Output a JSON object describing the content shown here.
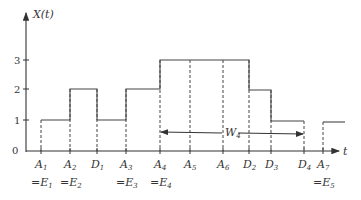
{
  "chart_data": {
    "type": "step",
    "title": "",
    "ylabel": "X(t)",
    "xlabel": "t",
    "yticks": [
      "0",
      "1",
      "2",
      "3"
    ],
    "ylim": [
      0,
      3
    ],
    "events": [
      {
        "name": "A",
        "sub": "1",
        "eq": "=E",
        "eqsub": "1",
        "x": 41
      },
      {
        "name": "A",
        "sub": "2",
        "eq": "=E",
        "eqsub": "2",
        "x": 70
      },
      {
        "name": "D",
        "sub": "1",
        "eq": "",
        "eqsub": "",
        "x": 97
      },
      {
        "name": "A",
        "sub": "3",
        "eq": "=E",
        "eqsub": "3",
        "x": 126
      },
      {
        "name": "A",
        "sub": "4",
        "eq": "=E",
        "eqsub": "4",
        "x": 160
      },
      {
        "name": "A",
        "sub": "5",
        "eq": "",
        "eqsub": "",
        "x": 190
      },
      {
        "name": "A",
        "sub": "6",
        "eq": "",
        "eqsub": "",
        "x": 223
      },
      {
        "name": "D",
        "sub": "2",
        "eq": "",
        "eqsub": "",
        "x": 249
      },
      {
        "name": "D",
        "sub": "3",
        "eq": "",
        "eqsub": "",
        "x": 271
      },
      {
        "name": "D",
        "sub": "4",
        "eq": "",
        "eqsub": "",
        "x": 304
      },
      {
        "name": "A",
        "sub": "7",
        "eq": "=E",
        "eqsub": "5",
        "x": 323
      }
    ],
    "steps": [
      {
        "from": "A1",
        "to": "A2",
        "value": 1
      },
      {
        "from": "A2",
        "to": "D1",
        "value": 2
      },
      {
        "from": "D1",
        "to": "A3",
        "value": 1
      },
      {
        "from": "A3",
        "to": "A4",
        "value": 2
      },
      {
        "from": "A4",
        "to": "D2",
        "value": 3
      },
      {
        "from": "D2",
        "to": "D3",
        "value": 2
      },
      {
        "from": "D3",
        "to": "D4",
        "value": 1
      },
      {
        "from": "D4",
        "to": "A7",
        "value": 0
      },
      {
        "from": "A7",
        "to": "end",
        "value": 1
      }
    ],
    "annotation": {
      "label": "W",
      "sub": "4",
      "from": "A4",
      "to": "D4"
    }
  },
  "axis": {
    "y_label": "X(t)",
    "x_label": "t",
    "ticks": [
      "0",
      "1",
      "2",
      "3"
    ]
  },
  "annotation": {
    "label": "W",
    "sub": "4"
  }
}
